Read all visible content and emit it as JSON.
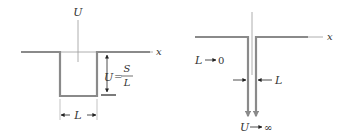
{
  "left_panel": {
    "axis_label_vertical": "U",
    "axis_label_horizontal": "x",
    "height_label_lhs": "U",
    "height_label_eq": "=",
    "height_label_num": "S",
    "height_label_den": "L",
    "width_label": "L"
  },
  "right_panel": {
    "axis_label_horizontal": "x",
    "limit_width_var": "L",
    "limit_width_value": "0",
    "width_label": "L",
    "limit_height_var": "U",
    "limit_height_value": "∞"
  },
  "colors": {
    "well_stroke": "#8a8a8a",
    "axis_stroke": "#9a9a9a",
    "text": "#333333",
    "arrow": "#222222"
  }
}
